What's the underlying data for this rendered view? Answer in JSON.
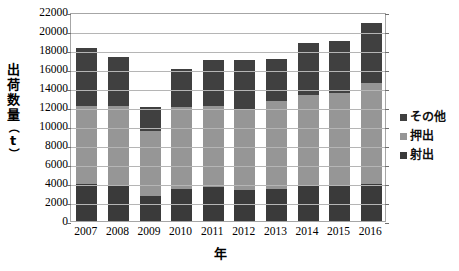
{
  "chart_data": {
    "type": "bar",
    "subtype": "stacked-column",
    "title": "",
    "xlabel": "年",
    "ylabel": "出荷数量（t）",
    "ylabel_chars": [
      "出",
      "荷",
      "数",
      "量",
      "（",
      "t",
      "）"
    ],
    "categories": [
      "2007",
      "2008",
      "2009",
      "2010",
      "2011",
      "2012",
      "2013",
      "2014",
      "2015",
      "2016"
    ],
    "ylim": [
      0,
      22000
    ],
    "ytick_step": 2000,
    "yticks": [
      "22000",
      "20000",
      "18000",
      "16000",
      "14000",
      "12000",
      "10000",
      "8000",
      "6000",
      "4000",
      "2000",
      "0"
    ],
    "ytick_values": [
      22000,
      20000,
      18000,
      16000,
      14000,
      12000,
      10000,
      8000,
      6000,
      4000,
      2000,
      0
    ],
    "grid": true,
    "grid_axis": "y",
    "legend_position": "right",
    "stack_order_bottom_to_top": [
      "射出",
      "押出",
      "その他"
    ],
    "series": [
      {
        "name": "射出",
        "color": "#3a3a3a",
        "values": [
          3900,
          3700,
          2600,
          3400,
          3600,
          3300,
          3400,
          3700,
          3700,
          3900
        ]
      },
      {
        "name": "押出",
        "color": "#969696",
        "values": [
          8200,
          8400,
          6900,
          8600,
          8500,
          8500,
          9200,
          9600,
          9800,
          10600
        ]
      },
      {
        "name": "その他",
        "color": "#404040",
        "values": [
          6100,
          5200,
          2500,
          4000,
          4800,
          5200,
          4500,
          5400,
          5500,
          6300
        ]
      }
    ],
    "totals": [
      18200,
      17300,
      12000,
      16000,
      16900,
      17000,
      17100,
      18700,
      19000,
      20800
    ]
  },
  "legend": {
    "items": [
      {
        "label": "その他",
        "color": "#404040"
      },
      {
        "label": "押出",
        "color": "#969696"
      },
      {
        "label": "射出",
        "color": "#3a3a3a"
      }
    ]
  },
  "colors": {
    "plot_border": "#a6a6a6",
    "gridline": "#b5b5b5",
    "background": "#ffffff",
    "text": "#000000"
  }
}
